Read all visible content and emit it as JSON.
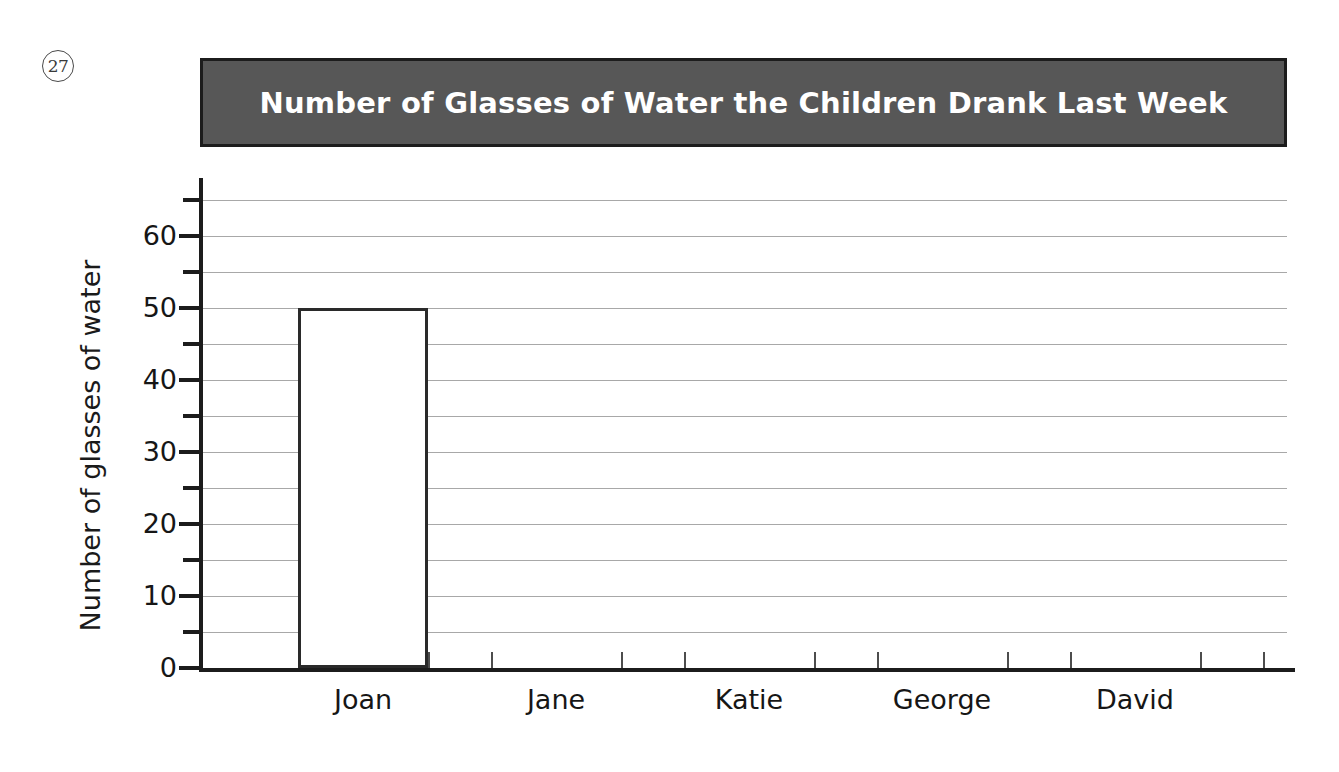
{
  "question_number": "27",
  "chart_data": {
    "type": "bar",
    "title": "Number of Glasses of Water the Children Drank Last Week",
    "xlabel": "",
    "ylabel": "Number of glasses of water",
    "categories": [
      "Joan",
      "Jane",
      "Katie",
      "George",
      "David"
    ],
    "values": [
      50,
      0,
      0,
      0,
      0
    ],
    "ylim": [
      0,
      65
    ],
    "y_major_ticks": [
      0,
      10,
      20,
      30,
      40,
      50,
      60
    ],
    "y_minor_tick_interval": 5,
    "y_tick_labels": [
      "0",
      "10",
      "20",
      "30",
      "40",
      "50",
      "60"
    ],
    "grid": true,
    "grid_interval": 5,
    "legend": null,
    "bar_fill": "#ffffff",
    "bar_outline": "#2a2a2a",
    "title_background": "#575757",
    "title_color": "#ffffff",
    "gridline_color": "#a8a8a8",
    "axis_color": "#1c1c1c"
  }
}
